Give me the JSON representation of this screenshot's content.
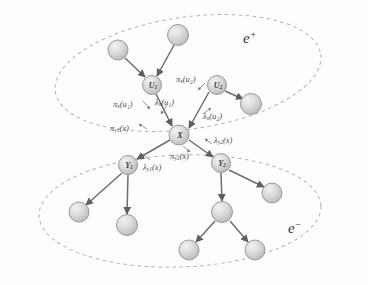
{
  "figure": {
    "background_color": "#fdfdfd",
    "node_fill_color": "#d9d9d9",
    "node_stroke_color": "#8c8c8c",
    "edge_color": "#6e6e6e",
    "ellipse_color": "#b0a8a0",
    "label_color": "#3a3a3a"
  },
  "regions": [
    {
      "id": "e-plus",
      "label": "e",
      "superscript": "+",
      "cx": 188,
      "cy": 73,
      "rx": 134,
      "ry": 56,
      "rotate": -8
    },
    {
      "id": "e-minus",
      "label": "e",
      "superscript": "−",
      "cx": 180,
      "cy": 211,
      "rx": 140,
      "ry": 56,
      "rotate": -2
    }
  ],
  "nodes": [
    {
      "id": "u1",
      "label": "U",
      "sub": "1",
      "cx": 152,
      "cy": 85,
      "r": 9.5,
      "named": true
    },
    {
      "id": "u2",
      "label": "U",
      "sub": "2",
      "cx": 217,
      "cy": 85,
      "r": 9.5,
      "named": true
    },
    {
      "id": "x",
      "label": "X",
      "sub": "",
      "cx": 179,
      "cy": 135,
      "r": 10,
      "named": true
    },
    {
      "id": "y1",
      "label": "Y",
      "sub": "1",
      "cx": 128,
      "cy": 165,
      "r": 9.5,
      "named": true
    },
    {
      "id": "y2",
      "label": "Y",
      "sub": "2",
      "cx": 221,
      "cy": 163,
      "r": 9.5,
      "named": true
    },
    {
      "id": "p1",
      "label": "",
      "sub": "",
      "cx": 118,
      "cy": 50,
      "r": 10,
      "named": false
    },
    {
      "id": "p2",
      "label": "",
      "sub": "",
      "cx": 178,
      "cy": 35,
      "r": 10.5,
      "named": false
    },
    {
      "id": "p3",
      "label": "",
      "sub": "",
      "cx": 251,
      "cy": 104,
      "r": 10.5,
      "named": false
    },
    {
      "id": "c1",
      "label": "",
      "sub": "",
      "cx": 79,
      "cy": 212,
      "r": 10,
      "named": false
    },
    {
      "id": "c2",
      "label": "",
      "sub": "",
      "cx": 127,
      "cy": 225,
      "r": 10.5,
      "named": false
    },
    {
      "id": "c3",
      "label": "",
      "sub": "",
      "cx": 272,
      "cy": 193,
      "r": 10,
      "named": false
    },
    {
      "id": "c4",
      "label": "",
      "sub": "",
      "cx": 222,
      "cy": 212,
      "r": 10.5,
      "named": false
    },
    {
      "id": "c5",
      "label": "",
      "sub": "",
      "cx": 189,
      "cy": 250,
      "r": 10,
      "named": false
    },
    {
      "id": "c6",
      "label": "",
      "sub": "",
      "cx": 255,
      "cy": 250,
      "r": 10,
      "named": false
    }
  ],
  "edges": [
    {
      "from": "p1",
      "to": "u1"
    },
    {
      "from": "p2",
      "to": "u1"
    },
    {
      "from": "u1",
      "to": "x"
    },
    {
      "from": "u2",
      "to": "x"
    },
    {
      "from": "u2",
      "to": "p3"
    },
    {
      "from": "x",
      "to": "y1"
    },
    {
      "from": "x",
      "to": "y2"
    },
    {
      "from": "y1",
      "to": "c1"
    },
    {
      "from": "y1",
      "to": "c2"
    },
    {
      "from": "y2",
      "to": "c3"
    },
    {
      "from": "y2",
      "to": "c4"
    },
    {
      "from": "c4",
      "to": "c5"
    },
    {
      "from": "c4",
      "to": "c6"
    }
  ],
  "messages": [
    {
      "id": "pi-x-u1",
      "pi_lambda": "π",
      "sub": "x",
      "arg": "(u₁)",
      "text": "πx(u1)",
      "x": 113,
      "y": 100,
      "angle": 0
    },
    {
      "id": "lam-x-u1",
      "pi_lambda": "λ",
      "sub": "x",
      "arg": "(u₁)",
      "text": "λx(u1)",
      "x": 155,
      "y": 98,
      "angle": 0
    },
    {
      "id": "pi-x-u2",
      "pi_lambda": "π",
      "sub": "x",
      "arg": "(u₂)",
      "text": "πx(u2)",
      "x": 176,
      "y": 75,
      "angle": 0
    },
    {
      "id": "lam-x-u2",
      "pi_lambda": "λ",
      "sub": "x",
      "arg": "(u₂)",
      "text": "λx(u2)",
      "x": 203,
      "y": 112,
      "angle": 0
    },
    {
      "id": "pi-y1-x",
      "pi_lambda": "π",
      "sub": "y1",
      "arg": "(x)",
      "text": "πy1(x)",
      "x": 113,
      "y": 124,
      "angle": 0
    },
    {
      "id": "lam-y2-x",
      "pi_lambda": "λ",
      "sub": "y2",
      "arg": "(x)",
      "text": "λy2(x)",
      "x": 212,
      "y": 138,
      "angle": 0
    },
    {
      "id": "pi-y2-x",
      "pi_lambda": "π",
      "sub": "y2",
      "arg": "(x)",
      "text": "πy2(x)",
      "x": 171,
      "y": 152,
      "angle": 0
    },
    {
      "id": "lam-y1-x",
      "pi_lambda": "λ",
      "sub": "y1",
      "arg": "(x)",
      "text": "λy1(x)",
      "x": 143,
      "y": 163,
      "angle": 0
    }
  ],
  "region_labels": [
    {
      "id": "e-plus-label",
      "base": "e",
      "sup": "+",
      "x": 243,
      "y": 36
    },
    {
      "id": "e-minus-label",
      "base": "e",
      "sup": "−",
      "x": 288,
      "y": 226
    }
  ]
}
